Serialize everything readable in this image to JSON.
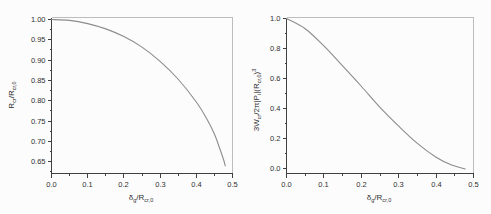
{
  "figure": {
    "background": "#fcfcfc"
  },
  "colors": {
    "axis": "#404040",
    "frame": "#bdbdbd",
    "curve": "#8c8c8c",
    "text": "#303030"
  },
  "chart_data": [
    {
      "type": "line",
      "title": "",
      "xlabel": "δg/Rcr,0",
      "ylabel": "Rcr/Rcr,0",
      "xlabel_parts": [
        [
          "δ",
          ""
        ],
        [
          "g",
          "sub"
        ],
        [
          "/R",
          ""
        ],
        [
          "cr,0",
          "sub"
        ]
      ],
      "ylabel_parts": [
        [
          "R",
          ""
        ],
        [
          "cr",
          "sub"
        ],
        [
          "/R",
          ""
        ],
        [
          "cr,0",
          "sub"
        ]
      ],
      "xlim": [
        0,
        0.5
      ],
      "ylim": [
        0.621,
        1.005
      ],
      "grid": false,
      "legend": "none",
      "xticks": {
        "major": [
          0,
          0.1,
          0.2,
          0.3,
          0.4,
          0.5
        ],
        "labels": [
          "0.0",
          "0.1",
          "0.2",
          "0.3",
          "0.4",
          "0.5"
        ],
        "minor_step": 0.05
      },
      "yticks": {
        "major": [
          0.65,
          0.7,
          0.75,
          0.8,
          0.85,
          0.9,
          0.95,
          1.0
        ],
        "labels": [
          "0.65",
          "0.70",
          "0.75",
          "0.80",
          "0.85",
          "0.90",
          "0.95",
          "1.00"
        ],
        "minor_step": 0.025
      },
      "series": [
        {
          "name": "Rcr/Rcr,0",
          "x": [
            0,
            0.05,
            0.1,
            0.15,
            0.2,
            0.25,
            0.3,
            0.35,
            0.4,
            0.43,
            0.45,
            0.465,
            0.475,
            0.48
          ],
          "y": [
            1.0,
            0.998,
            0.99,
            0.977,
            0.958,
            0.932,
            0.897,
            0.853,
            0.797,
            0.754,
            0.718,
            0.682,
            0.656,
            0.64
          ]
        }
      ]
    },
    {
      "type": "line",
      "title": "",
      "xlabel": "δg/Rcr,0",
      "ylabel": "3Wcr/2π|Pi|(Rcr,0)3",
      "xlabel_parts": [
        [
          "δ",
          ""
        ],
        [
          "g",
          "sub"
        ],
        [
          "/R",
          ""
        ],
        [
          "cr,0",
          "sub"
        ]
      ],
      "ylabel_parts": [
        [
          "3W",
          ""
        ],
        [
          "cr",
          "sub"
        ],
        [
          "/2π|P",
          ""
        ],
        [
          "i",
          "sub"
        ],
        [
          "|(R",
          ""
        ],
        [
          "cr,0",
          "sub"
        ],
        [
          ")",
          ""
        ],
        [
          "3",
          "sup"
        ]
      ],
      "xlim": [
        0,
        0.5
      ],
      "ylim": [
        -0.03,
        1.007
      ],
      "grid": false,
      "legend": "none",
      "xticks": {
        "major": [
          0,
          0.1,
          0.2,
          0.3,
          0.4,
          0.5
        ],
        "labels": [
          "0.0",
          "0.1",
          "0.2",
          "0.3",
          "0.4",
          "0.5"
        ],
        "minor_step": 0.05
      },
      "yticks": {
        "major": [
          0.0,
          0.2,
          0.4,
          0.6,
          0.8,
          1.0
        ],
        "labels": [
          "0.0",
          "0.2",
          "0.4",
          "0.6",
          "0.8",
          "1.0"
        ],
        "minor_step": 0.1
      },
      "series": [
        {
          "name": "3Wcr/2π|Pi|(Rcr,0)³",
          "x": [
            0,
            0.05,
            0.1,
            0.15,
            0.2,
            0.25,
            0.3,
            0.35,
            0.4,
            0.44,
            0.478
          ],
          "y": [
            1.0,
            0.932,
            0.818,
            0.685,
            0.55,
            0.41,
            0.285,
            0.17,
            0.078,
            0.028,
            0.0
          ]
        }
      ]
    }
  ]
}
